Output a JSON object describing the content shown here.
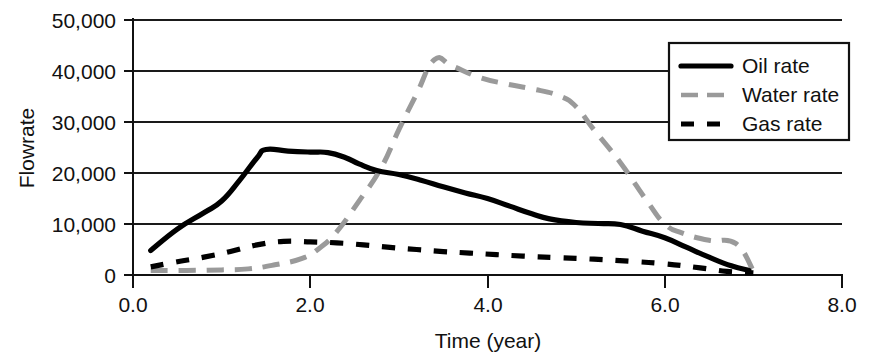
{
  "chart_data": {
    "type": "line",
    "title": "",
    "xlabel": "Time (year)",
    "ylabel": "Flowrate",
    "xlim": [
      0.0,
      8.0
    ],
    "ylim": [
      0,
      50000
    ],
    "grid": true,
    "legend_position": "top-right",
    "x_ticks": [
      "0.0",
      "2.0",
      "4.0",
      "6.0",
      "8.0"
    ],
    "x_tick_values": [
      0.0,
      2.0,
      4.0,
      6.0,
      8.0
    ],
    "y_ticks": [
      "0",
      "10,000",
      "20,000",
      "30,000",
      "40,000",
      "50,000"
    ],
    "y_tick_values": [
      0,
      10000,
      20000,
      30000,
      40000,
      50000
    ],
    "series": [
      {
        "name": "Oil rate",
        "style": "solid",
        "color": "#000000",
        "x": [
          0.2,
          0.5,
          0.8,
          1.0,
          1.2,
          1.4,
          1.5,
          1.75,
          2.0,
          2.2,
          2.4,
          2.55,
          2.75,
          3.0,
          3.25,
          3.5,
          3.75,
          4.0,
          4.25,
          4.5,
          4.7,
          5.0,
          5.25,
          5.5,
          5.75,
          6.0,
          6.25,
          6.5,
          6.75,
          6.95
        ],
        "y": [
          4800,
          9000,
          12200,
          14500,
          18500,
          23000,
          24600,
          24300,
          24100,
          24000,
          23000,
          21800,
          20500,
          19700,
          18600,
          17300,
          16100,
          15000,
          13500,
          12000,
          11000,
          10300,
          10100,
          9900,
          8600,
          7300,
          5400,
          3500,
          1800,
          900
        ]
      },
      {
        "name": "Water rate",
        "style": "dash-dot",
        "color": "#9a9a9a",
        "x": [
          0.2,
          0.6,
          1.0,
          1.3,
          1.6,
          1.9,
          2.1,
          2.3,
          2.55,
          2.8,
          3.0,
          3.2,
          3.4,
          3.6,
          3.9,
          4.2,
          4.5,
          4.8,
          5.0,
          5.2,
          5.5,
          5.8,
          6.0,
          6.2,
          6.5,
          6.8,
          7.0
        ],
        "y": [
          900,
          900,
          1000,
          1200,
          2000,
          3200,
          5200,
          8500,
          14500,
          21000,
          28500,
          35500,
          42200,
          41000,
          38800,
          37500,
          36500,
          35200,
          33000,
          28500,
          22000,
          14500,
          10000,
          8200,
          6800,
          6200,
          800
        ]
      },
      {
        "name": "Gas rate",
        "style": "dashed",
        "color": "#000000",
        "x": [
          0.2,
          0.5,
          0.8,
          1.1,
          1.4,
          1.7,
          2.0,
          2.3,
          2.6,
          2.9,
          3.2,
          3.5,
          3.8,
          4.1,
          4.4,
          4.8,
          5.2,
          5.6,
          6.0,
          6.4,
          6.7,
          7.0
        ],
        "y": [
          1600,
          2600,
          3500,
          4600,
          5900,
          6600,
          6500,
          6300,
          5900,
          5400,
          5000,
          4600,
          4300,
          4000,
          3700,
          3400,
          3100,
          2700,
          2200,
          1400,
          700,
          400
        ]
      }
    ]
  },
  "legend": {
    "entries": [
      {
        "label": "Oil rate"
      },
      {
        "label": "Water rate"
      },
      {
        "label": "Gas rate"
      }
    ]
  }
}
